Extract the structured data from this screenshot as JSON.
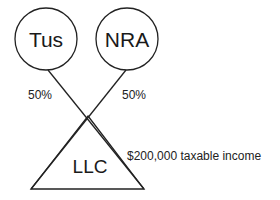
{
  "diagram": {
    "owners": [
      {
        "id": "tus",
        "label": "Tus",
        "ownership": "50%"
      },
      {
        "id": "nra",
        "label": "NRA",
        "ownership": "50%"
      }
    ],
    "entity": {
      "label": "LLC",
      "shape": "triangle",
      "annotation": "$200,000 taxable income"
    },
    "colors": {
      "stroke": "#222222",
      "background": "#ffffff"
    }
  }
}
